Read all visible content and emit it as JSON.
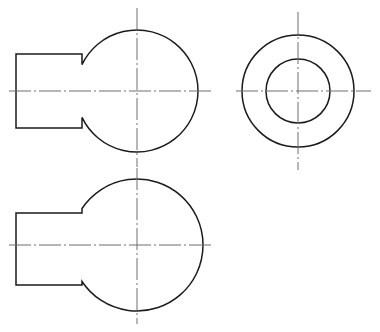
{
  "sheet": {
    "title": "Orthographic projection drawing",
    "background_color": "#ffffff",
    "width": 380,
    "height": 332,
    "outline_color": "#1b1b1b",
    "centerline_color": "#6e6e6e",
    "outline_width": 1.5,
    "centerline_width": 1
  },
  "views": {
    "front_view": {
      "name": "front-view",
      "circle": {
        "cx": 137,
        "cy": 91,
        "r": 61
      },
      "boss_rect": {
        "x": 16,
        "y": 54,
        "width": 66,
        "height": 74
      },
      "horizontal_centerline": {
        "x1": 9,
        "y1": 91,
        "x2": 212,
        "y2": 91
      },
      "vertical_centerline": {
        "x1": 137,
        "y1": 8,
        "x2": 137,
        "y2": 167
      }
    },
    "side_view": {
      "name": "side-view",
      "outer_circle": {
        "cx": 298,
        "cy": 91,
        "r": 56
      },
      "inner_circle": {
        "cx": 298,
        "cy": 91,
        "r": 32
      },
      "horizontal_centerline": {
        "x1": 236,
        "y1": 91,
        "x2": 371,
        "y2": 91
      },
      "vertical_centerline": {
        "x1": 298,
        "y1": 12,
        "x2": 298,
        "y2": 170
      }
    },
    "bottom_view": {
      "name": "bottom-view",
      "circle": {
        "cx": 137,
        "cy": 245,
        "r": 66
      },
      "boss_rect": {
        "x": 16,
        "y": 213,
        "width": 66,
        "height": 72
      },
      "horizontal_centerline": {
        "x1": 9,
        "y1": 245,
        "x2": 212,
        "y2": 245
      },
      "vertical_centerline": {
        "x1": 137,
        "y1": 168,
        "x2": 137,
        "y2": 324
      }
    }
  }
}
